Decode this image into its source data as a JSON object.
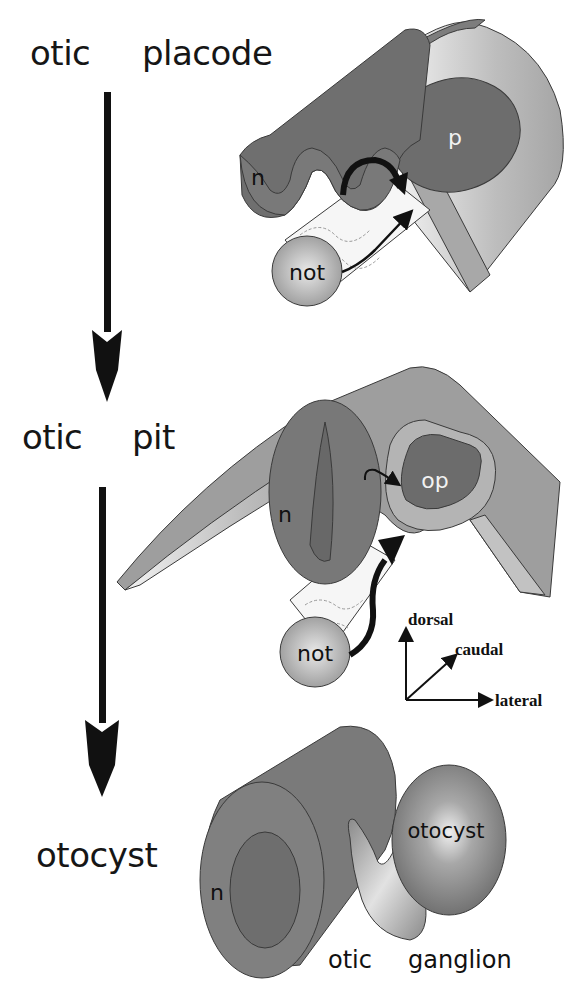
{
  "stages": [
    {
      "id": "placode",
      "word1": "otic",
      "word2": "placode"
    },
    {
      "id": "pit",
      "word1": "otic",
      "word2": "pit"
    },
    {
      "id": "otocyst",
      "word1": "otocyst"
    }
  ],
  "panel_placode": {
    "neural_tube_label": "n",
    "placode_label": "p",
    "notochord_label": "not"
  },
  "panel_pit": {
    "neural_tube_label": "n",
    "otic_pit_label": "op",
    "notochord_label": "not"
  },
  "panel_otocyst": {
    "neural_tube_label": "n",
    "otocyst_label": "otocyst",
    "ganglion_label_1": "otic",
    "ganglion_label_2": "ganglion"
  },
  "orientation_axes": {
    "up": "dorsal",
    "diagonal": "caudal",
    "right": "lateral"
  },
  "colors": {
    "dark_tissue": "#6e6e6e",
    "mid_tissue": "#8f8f8f",
    "light_tissue": "#b9b9b9",
    "outline": "#3a3a3a",
    "arrow": "#111111"
  }
}
